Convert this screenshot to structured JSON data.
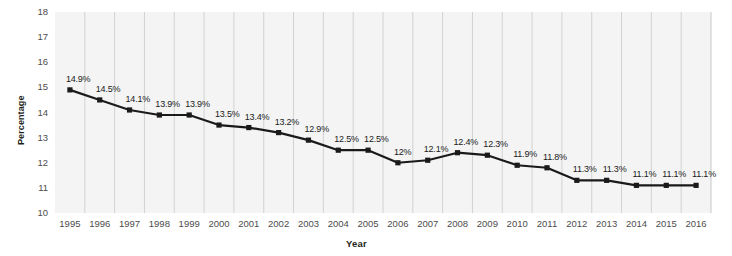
{
  "chart_data": {
    "type": "line",
    "title": "",
    "xlabel": "Year",
    "ylabel": "Percentage",
    "categories": [
      "1995",
      "1996",
      "1997",
      "1998",
      "1999",
      "2000",
      "2001",
      "2002",
      "2003",
      "2004",
      "2005",
      "2006",
      "2007",
      "2008",
      "2009",
      "2010",
      "2011",
      "2012",
      "2013",
      "2014",
      "2015",
      "2016"
    ],
    "values": [
      14.9,
      14.5,
      14.1,
      13.9,
      13.9,
      13.5,
      13.4,
      13.2,
      12.9,
      12.5,
      12.5,
      12.0,
      12.1,
      12.4,
      12.3,
      11.9,
      11.8,
      11.3,
      11.3,
      11.1,
      11.1,
      11.1
    ],
    "point_labels": [
      "14.9%",
      "14.5%",
      "14.1%",
      "13.9%",
      "13.9%",
      "13.5%",
      "13.4%",
      "13.2%",
      "12.9%",
      "12.5%",
      "12.5%",
      "12%",
      "12.1%",
      "12.4%",
      "12.3%",
      "11.9%",
      "11.8%",
      "11.3%",
      "11.3%",
      "11.1%",
      "11.1%",
      "11.1%"
    ],
    "ylim": [
      10,
      18
    ],
    "ytick_labels": [
      "18",
      "17",
      "16",
      "15",
      "14",
      "13",
      "12",
      "11",
      "10"
    ],
    "yticks": [
      18,
      17,
      16,
      15,
      14,
      13,
      12,
      11,
      10
    ],
    "grid": "vertical-only",
    "legend": "none",
    "series_color": "#1a1a1a",
    "marker": "square",
    "plot_background": "#f4f4f4",
    "gridline_color": "#d2d2d2"
  }
}
